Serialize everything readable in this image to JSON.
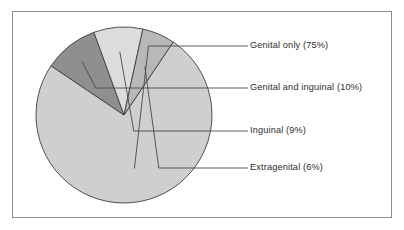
{
  "figure": {
    "background_color": "#ffffff",
    "frame_color": "#8c8c8c"
  },
  "chart_data": {
    "type": "pie",
    "title": "",
    "xlabel": "",
    "ylabel": "",
    "legend_position": "right-callout-labels",
    "grid": false,
    "categories": [
      "Genital only",
      "Genital and inguinal",
      "Inguinal",
      "Extragenital"
    ],
    "values": [
      75,
      10,
      9,
      6
    ],
    "unit": "%",
    "colors": [
      "#cfcfcf",
      "#8f8f8f",
      "#dcdcdc",
      "#b8b8b8"
    ],
    "labels": [
      "Genital only (75%)",
      "Genital and inguinal (10%)",
      "Inguinal (9%)",
      "Extragenital (6%)"
    ],
    "annotations": [
      {
        "text": "Genital only (75%)",
        "value": 75,
        "color": "#cfcfcf"
      },
      {
        "text": "Genital and inguinal (10%)",
        "value": 10,
        "color": "#8f8f8f"
      },
      {
        "text": "Inguinal (9%)",
        "value": 9,
        "color": "#dcdcdc"
      },
      {
        "text": "Extragenital (6%)",
        "value": 6,
        "color": "#b8b8b8"
      }
    ],
    "geometry": {
      "center_x": 124,
      "center_y": 115,
      "radius": 88,
      "start_angle_deg": -56
    }
  }
}
